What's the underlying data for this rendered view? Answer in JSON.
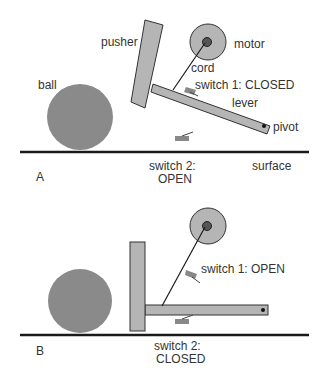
{
  "panels": [
    {
      "id": "A",
      "label": "A",
      "labels": {
        "pusher": "pusher",
        "motor": "motor",
        "cord": "cord",
        "ball": "ball",
        "switch1": "switch 1: CLOSED",
        "lever": "lever",
        "pivot": "pivot",
        "switch2_line1": "switch 2:",
        "switch2_line2": "OPEN",
        "surface": "surface"
      }
    },
    {
      "id": "B",
      "label": "B",
      "labels": {
        "switch1": "switch 1: OPEN",
        "switch2_line1": "switch 2:",
        "switch2_line2": "CLOSED"
      }
    }
  ],
  "colors": {
    "part_fill": "#b5b5b5",
    "ball_fill": "#8a8a8a",
    "outline": "#333333",
    "surface": "#1a1a1a",
    "switch": "#888888"
  }
}
